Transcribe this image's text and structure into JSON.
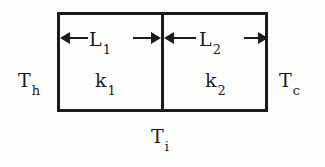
{
  "diagram": {
    "type": "engineering-schematic",
    "background_color": "#fdfdfc",
    "ink_color": "#1b1b1b",
    "geometry": {
      "wall_rect": {
        "x": 57,
        "y": 12,
        "width": 211,
        "height": 100
      },
      "divider_x": 161,
      "layer_1_width": 104,
      "layer_2_width": 107
    },
    "labels": {
      "hot_temperature": {
        "base": "T",
        "sub": "h"
      },
      "cold_temperature": {
        "base": "T",
        "sub": "c"
      },
      "interface_temperature": {
        "base": "T",
        "sub": "i"
      },
      "thickness_1": {
        "base": "L",
        "sub": "1"
      },
      "thickness_2": {
        "base": "L",
        "sub": "2"
      },
      "conductivity_1": {
        "base": "k",
        "sub": "1"
      },
      "conductivity_2": {
        "base": "k",
        "sub": "2"
      }
    },
    "dimension_rows": [
      {
        "name": "layer-1-thickness",
        "arrow_left": "←",
        "arrow_right": "→"
      },
      {
        "name": "layer-2-thickness",
        "arrow_left": "←",
        "arrow_right": "→"
      }
    ]
  }
}
